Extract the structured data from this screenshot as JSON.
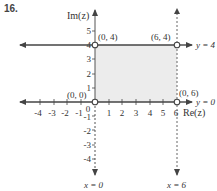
{
  "problem_number": "16.",
  "axes": {
    "x_label": "Re(z)",
    "y_label": "Im(z)",
    "x_ticks": [
      "-4",
      "-3",
      "-2",
      "-1",
      "1",
      "2",
      "3",
      "4",
      "5",
      "6"
    ],
    "y_ticks": [
      "5",
      "4",
      "3",
      "2",
      "1",
      "-1",
      "-2",
      "-3",
      "-4"
    ],
    "origin_label": "0"
  },
  "points": [
    {
      "label": "(0, 4)",
      "x": 0,
      "y": 4
    },
    {
      "label": "(6, 4)",
      "x": 6,
      "y": 4
    },
    {
      "label": "(0, 0)",
      "x": 0,
      "y": 0
    },
    {
      "label": "(0, 6)",
      "x": 6,
      "y": 0
    }
  ],
  "lines": [
    {
      "label": "y = 4",
      "style": "solid"
    },
    {
      "label": "y = 0",
      "style": "solid"
    },
    {
      "label": "x = 0",
      "style": "dashed"
    },
    {
      "label": "x = 6",
      "style": "dashed"
    }
  ],
  "region": {
    "x_min": 0,
    "x_max": 6,
    "y_min": 0,
    "y_max": 4,
    "fill": "#ececec"
  },
  "colors": {
    "line": "#444444",
    "fill": "#ececec",
    "text": "#333333"
  }
}
